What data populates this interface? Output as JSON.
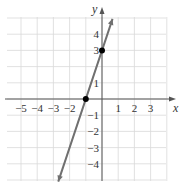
{
  "chart_data": {
    "type": "line",
    "title": "",
    "xlabel": "x",
    "ylabel": "y",
    "xlim": [
      -6,
      4
    ],
    "ylim": [
      -5,
      5
    ],
    "grid": true,
    "x_ticks": [
      -5,
      -4,
      -3,
      -2,
      1,
      2,
      3
    ],
    "x_tick_labels": [
      "−5",
      "−4",
      "−3",
      "−2",
      "1",
      "2",
      "3"
    ],
    "y_ticks": [
      4,
      3,
      1,
      -1,
      -2,
      -3,
      -4
    ],
    "y_tick_labels": [
      "4",
      "3",
      "1",
      "−1",
      "−2",
      "−3",
      "−4"
    ],
    "series": [
      {
        "name": "line y = 3x + 3",
        "slope": 3,
        "intercept": 3,
        "x_range": [
          -2.7,
          0.65
        ],
        "color": "#707070"
      }
    ],
    "points": [
      {
        "x": -1,
        "y": 0,
        "label": "x-intercept"
      },
      {
        "x": 0,
        "y": 3,
        "label": "y-intercept"
      }
    ]
  },
  "axes": {
    "x_label": "x",
    "y_label": "y"
  },
  "colors": {
    "grid": "#d9d9d9",
    "axis": "#555555",
    "line": "#707070",
    "point": "#000000"
  }
}
